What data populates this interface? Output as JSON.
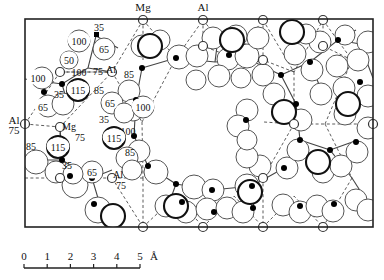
{
  "figure": {
    "type": "crystal-structure-projection",
    "frame": {
      "x": 25,
      "y": 19,
      "width": 348,
      "height": 208
    },
    "atom_labels": {
      "mg": "Mg",
      "al": "Al"
    },
    "boundary_labels": [
      {
        "id": "mg-top",
        "text": "Mg",
        "x": 143,
        "y": 11
      },
      {
        "id": "al-top",
        "text": "Al",
        "x": 203,
        "y": 11
      },
      {
        "id": "al-left",
        "text": "Al",
        "x": 14,
        "y": 124
      },
      {
        "id": "al-left-height",
        "text": "75",
        "x": 14,
        "y": 134
      }
    ],
    "height_labels": [
      {
        "text": "35",
        "x": 99,
        "y": 27,
        "boxed": false
      },
      {
        "text": "100",
        "x": 79,
        "y": 41,
        "boxed": true
      },
      {
        "text": "65",
        "x": 104,
        "y": 49,
        "boxed": true
      },
      {
        "text": "50",
        "x": 69,
        "y": 60,
        "boxed": true
      },
      {
        "text": "100",
        "x": 79,
        "y": 72,
        "boxed": false
      },
      {
        "text": "75",
        "x": 98,
        "y": 71,
        "boxed": false
      },
      {
        "text": "Al",
        "x": 111,
        "y": 69,
        "boxed": false
      },
      {
        "text": "85",
        "x": 129,
        "y": 74,
        "boxed": false
      },
      {
        "text": "100",
        "x": 38,
        "y": 78,
        "boxed": true
      },
      {
        "text": "35",
        "x": 59,
        "y": 94,
        "boxed": false
      },
      {
        "text": "115",
        "x": 78,
        "y": 90,
        "boxed": true
      },
      {
        "text": "85",
        "x": 99,
        "y": 90,
        "boxed": false
      },
      {
        "text": "65",
        "x": 43,
        "y": 107,
        "boxed": true
      },
      {
        "text": "65",
        "x": 110,
        "y": 103,
        "boxed": true
      },
      {
        "text": "100",
        "x": 143,
        "y": 107,
        "boxed": true
      },
      {
        "text": "35",
        "x": 104,
        "y": 119,
        "boxed": false
      },
      {
        "text": "Mg",
        "x": 69,
        "y": 126,
        "boxed": false
      },
      {
        "text": "75",
        "x": 80,
        "y": 137,
        "boxed": false
      },
      {
        "text": "100",
        "x": 128,
        "y": 131,
        "boxed": false
      },
      {
        "text": "115",
        "x": 114,
        "y": 138,
        "boxed": true
      },
      {
        "text": "85",
        "x": 130,
        "y": 152,
        "boxed": false
      },
      {
        "text": "85",
        "x": 31,
        "y": 146,
        "boxed": false
      },
      {
        "text": "115",
        "x": 58,
        "y": 147,
        "boxed": true
      },
      {
        "text": "35",
        "x": 67,
        "y": 165,
        "boxed": false
      },
      {
        "text": "65",
        "x": 92,
        "y": 172,
        "boxed": true
      },
      {
        "text": "Al",
        "x": 118,
        "y": 174,
        "boxed": false
      },
      {
        "text": "75",
        "x": 121,
        "y": 185,
        "boxed": false
      }
    ],
    "scale_bar": {
      "ticks": [
        "0",
        "1",
        "2",
        "3",
        "4",
        "5"
      ],
      "unit": "Å",
      "x_start": 24,
      "x_end": 140,
      "y": 268
    }
  }
}
